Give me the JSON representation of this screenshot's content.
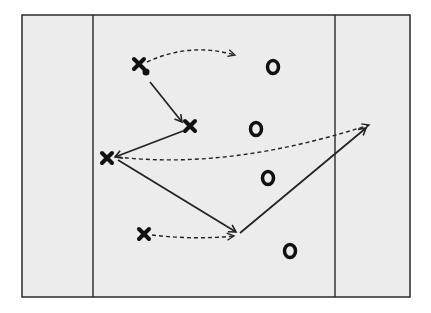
{
  "diagram": {
    "type": "sports-play-diagram",
    "colors": {
      "background": "#ffffff",
      "field": "#ececec",
      "lines": "#2a2a2a",
      "markers": "#111111"
    },
    "field": {
      "x": 22,
      "y": 15,
      "width": 388,
      "height": 282
    },
    "zone_lines": [
      {
        "x": 93
      },
      {
        "x": 335
      }
    ],
    "offense_players": [
      {
        "id": "X1",
        "x": 139,
        "y": 64,
        "has_ball": true
      },
      {
        "id": "X2",
        "x": 190,
        "y": 126,
        "has_ball": false
      },
      {
        "id": "X3",
        "x": 107,
        "y": 158,
        "has_ball": false
      },
      {
        "id": "X4",
        "x": 144,
        "y": 234,
        "has_ball": false
      }
    ],
    "ball": {
      "x": 146,
      "y": 72
    },
    "defense_players": [
      {
        "id": "O1",
        "x": 273,
        "y": 67
      },
      {
        "id": "O2",
        "x": 256,
        "y": 129
      },
      {
        "id": "O3",
        "x": 268,
        "y": 178
      },
      {
        "id": "O4",
        "x": 290,
        "y": 251
      }
    ],
    "passes": [
      {
        "type": "pass",
        "style": "solid",
        "from": [
          150,
          82
        ],
        "to": [
          182,
          122
        ]
      },
      {
        "type": "pass",
        "style": "solid",
        "from": [
          183,
          131
        ],
        "to": [
          115,
          157
        ]
      },
      {
        "type": "pass",
        "style": "solid",
        "from": [
          118,
          160
        ],
        "to": [
          236,
          232
        ]
      },
      {
        "type": "pass",
        "style": "solid",
        "from": [
          240,
          233
        ],
        "to": [
          366,
          128
        ]
      }
    ],
    "cuts": [
      {
        "type": "cut",
        "style": "dashed",
        "path": "M147 62 Q190 42 235 55"
      },
      {
        "type": "cut",
        "style": "dashed",
        "path": "M118 157 Q230 170 369 125"
      },
      {
        "type": "cut",
        "style": "dashed",
        "path": "M152 235 Q195 240 234 236"
      }
    ]
  }
}
